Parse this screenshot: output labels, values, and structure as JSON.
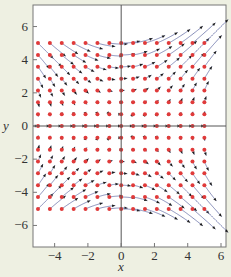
{
  "chart_data": {
    "type": "vector_field",
    "title": "",
    "xlabel": "x",
    "ylabel": "y",
    "xlim": [
      -5.3,
      6.3
    ],
    "ylim": [
      -7.3,
      7.3
    ],
    "x_ticks": [
      -4,
      -2,
      0,
      2,
      4,
      6
    ],
    "y_ticks": [
      -6,
      -4,
      -2,
      0,
      2,
      4,
      6
    ],
    "x_tick_labels": [
      "−4",
      "−2",
      "0",
      "2",
      "4",
      "6"
    ],
    "y_tick_labels": [
      "−6",
      "−4",
      "−2",
      "0",
      "2",
      "4",
      "6"
    ],
    "grid": false,
    "legend": null,
    "field": {
      "dx": "y^2",
      "dy": "x*y"
    },
    "sample_points": {
      "x_range": [
        -5,
        5
      ],
      "y_range": [
        -5,
        5
      ],
      "n": 15
    },
    "trajectory_time": 0.045,
    "colors": {
      "point": "#e03a3a",
      "line": "#6a72a8",
      "arrowhead": "#1c1c1c",
      "axes": "#555555",
      "frame": "#777777",
      "plot_bg": "#ffffff",
      "page_bg": "#eef0e2"
    }
  }
}
